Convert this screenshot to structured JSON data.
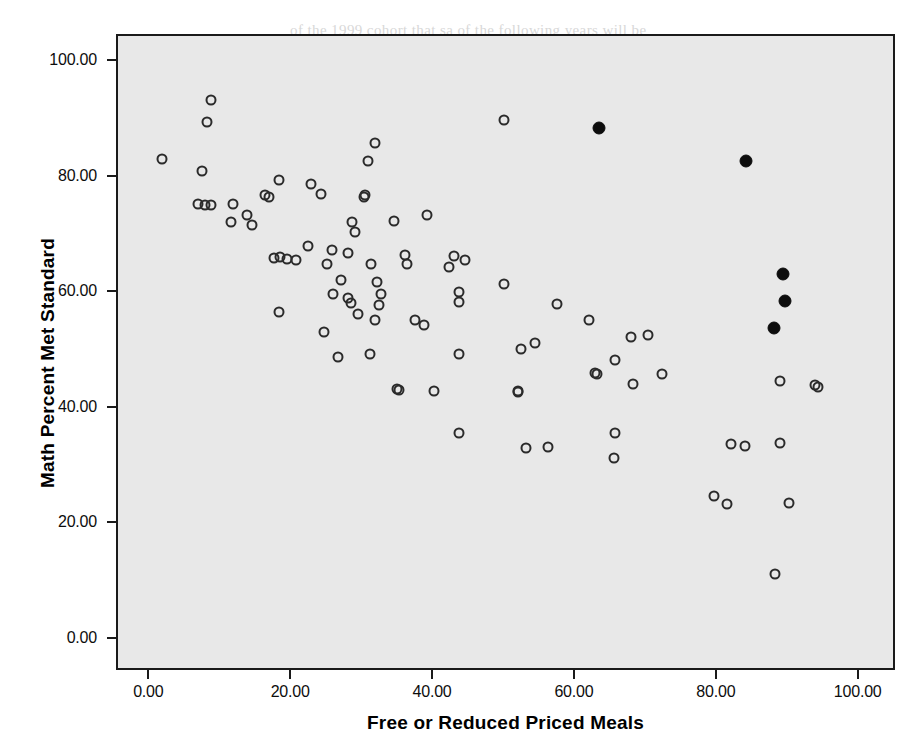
{
  "chart_data": {
    "type": "scatter",
    "title": "",
    "xlabel": "Free or Reduced Priced Meals",
    "ylabel": "Math Percent Met Standard",
    "xlim": [
      -5.0,
      106.0
    ],
    "ylim": [
      -7.0,
      107.0
    ],
    "xticks": [
      "0.00",
      "20.00",
      "40.00",
      "60.00",
      "80.00",
      "100.00"
    ],
    "xtick_values": [
      0,
      20,
      40,
      60,
      80,
      100
    ],
    "yticks": [
      "0.00",
      "20.00",
      "40.00",
      "60.00",
      "80.00",
      "100.00"
    ],
    "ytick_values": [
      0,
      20,
      40,
      60,
      80,
      100
    ],
    "grid": false,
    "legend": "none",
    "plot_background": "#e8e8e8",
    "marker_open_color": "#2b2b2b",
    "marker_filled_color": "#0d0d0d",
    "series": [
      {
        "name": "Schools (unmarked)",
        "marker": "open-circle",
        "points": [
          [
            1.7,
            83.2
          ],
          [
            8.5,
            93.5
          ],
          [
            8.0,
            89.6
          ],
          [
            7.3,
            81.1
          ],
          [
            6.7,
            75.4
          ],
          [
            7.7,
            75.3
          ],
          [
            8.6,
            75.2
          ],
          [
            11.7,
            75.5
          ],
          [
            11.4,
            72.3
          ],
          [
            13.7,
            73.5
          ],
          [
            14.3,
            71.8
          ],
          [
            16.1,
            77.0
          ],
          [
            16.8,
            76.6
          ],
          [
            18.1,
            79.6
          ],
          [
            18.3,
            66.2
          ],
          [
            17.4,
            66.1
          ],
          [
            19.2,
            65.9
          ],
          [
            20.6,
            65.7
          ],
          [
            18.1,
            56.7
          ],
          [
            22.7,
            78.9
          ],
          [
            24.1,
            77.2
          ],
          [
            22.2,
            68.1
          ],
          [
            24.5,
            53.3
          ],
          [
            25.8,
            59.9
          ],
          [
            26.9,
            62.2
          ],
          [
            25.6,
            67.4
          ],
          [
            24.9,
            65.0
          ],
          [
            27.9,
            67.0
          ],
          [
            27.9,
            59.1
          ],
          [
            28.3,
            58.2
          ],
          [
            28.4,
            72.3
          ],
          [
            28.8,
            70.5
          ],
          [
            29.3,
            56.4
          ],
          [
            26.4,
            48.9
          ],
          [
            30.1,
            76.6
          ],
          [
            30.2,
            77.0
          ],
          [
            30.7,
            82.8
          ],
          [
            31.7,
            86.0
          ],
          [
            31.1,
            65.0
          ],
          [
            32.0,
            61.9
          ],
          [
            32.5,
            59.8
          ],
          [
            32.3,
            58.0
          ],
          [
            31.7,
            55.4
          ],
          [
            31.0,
            49.5
          ],
          [
            34.4,
            72.4
          ],
          [
            35.9,
            66.6
          ],
          [
            36.2,
            65.0
          ],
          [
            34.8,
            43.4
          ],
          [
            35.0,
            43.2
          ],
          [
            37.3,
            55.4
          ],
          [
            38.6,
            54.5
          ],
          [
            39.0,
            73.5
          ],
          [
            40.0,
            43.1
          ],
          [
            42.8,
            66.4
          ],
          [
            42.1,
            64.6
          ],
          [
            43.5,
            60.2
          ],
          [
            43.5,
            58.5
          ],
          [
            43.5,
            49.4
          ],
          [
            43.5,
            35.8
          ],
          [
            44.3,
            65.8
          ],
          [
            49.8,
            61.5
          ],
          [
            49.8,
            89.9
          ],
          [
            51.9,
            43.0
          ],
          [
            51.9,
            42.9
          ],
          [
            52.3,
            50.4
          ],
          [
            54.2,
            51.4
          ],
          [
            53.0,
            33.1
          ],
          [
            56.1,
            33.4
          ],
          [
            57.4,
            58.1
          ],
          [
            61.9,
            55.4
          ],
          [
            62.7,
            46.2
          ],
          [
            62.9,
            46.0
          ],
          [
            65.5,
            48.4
          ],
          [
            65.5,
            35.7
          ],
          [
            65.4,
            31.5
          ],
          [
            67.8,
            52.4
          ],
          [
            68.1,
            44.3
          ],
          [
            70.2,
            52.8
          ],
          [
            72.1,
            46.0
          ],
          [
            79.4,
            24.9
          ],
          [
            81.3,
            23.5
          ],
          [
            81.9,
            33.9
          ],
          [
            83.9,
            33.6
          ],
          [
            88.7,
            44.8
          ],
          [
            88.8,
            34.1
          ],
          [
            90.0,
            23.7
          ],
          [
            88.0,
            11.4
          ],
          [
            93.7,
            44.1
          ],
          [
            94.1,
            43.8
          ]
        ]
      },
      {
        "name": "Highlighted schools",
        "marker": "filled-circle",
        "points": [
          [
            63.3,
            88.5
          ],
          [
            84.0,
            82.8
          ],
          [
            89.2,
            63.3
          ],
          [
            89.4,
            58.6
          ],
          [
            87.9,
            53.9
          ]
        ]
      }
    ]
  },
  "bleed_through_lines": [
    {
      "text": "of the 1999 cohort that sa of the following years will be",
      "x": 290,
      "y": 22
    },
    {
      "text": "the 1999 cohort",
      "x": 398,
      "y": 48
    },
    {
      "text": "ich of the 1999 cohort. Year 2 was the 2000-2001",
      "x": 330,
      "y": 100
    },
    {
      "text": "nning of each school year for",
      "x": 380,
      "y": 150
    },
    {
      "text": "ers of students with the who",
      "x": 345,
      "y": 195
    },
    {
      "text": "building ability levels that",
      "x": 360,
      "y": 215
    },
    {
      "text": "rtion of students with differ",
      "x": 352,
      "y": 330
    },
    {
      "text": "e students from every school",
      "x": 352,
      "y": 410
    },
    {
      "text": "r staffing and by developing an plans for",
      "x": 215,
      "y": 520
    },
    {
      "text": "rious fashion. A possible factor of each class may be that",
      "x": 190,
      "y": 545
    },
    {
      "text": "smaller class sizes, this would allow for more teacher and",
      "x": 180,
      "y": 570
    },
    {
      "text": "individually. It was on the second year, class size and",
      "x": 180,
      "y": 597
    },
    {
      "text": "ature of this approach at Jenner Avenue Elementary",
      "x": 200,
      "y": 622
    }
  ]
}
